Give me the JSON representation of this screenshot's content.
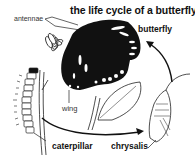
{
  "diagram": {
    "title": "the life cycle of a butterfly",
    "labels": {
      "antennae": "antennae",
      "butterfly": "butterfly",
      "wing": "wing",
      "caterpillar": "caterpillar",
      "chrysalis": "chrysalis"
    },
    "stages": [
      "caterpillar",
      "chrysalis",
      "butterfly"
    ],
    "colors": {
      "ink": "#111111",
      "background": "#ffffff",
      "line": "#222222"
    }
  }
}
